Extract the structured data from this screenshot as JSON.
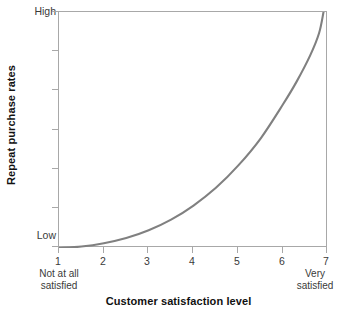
{
  "chart_data": {
    "type": "line",
    "title": "",
    "xlabel": "Customer satisfaction level",
    "ylabel": "Repeat purchase rates",
    "x": [
      1,
      1.5,
      2,
      2.5,
      3,
      3.5,
      4,
      4.5,
      5,
      5.5,
      6,
      6.3,
      6.6,
      6.8,
      6.9
    ],
    "values": [
      0.0,
      0.6,
      2.0,
      4.2,
      7.5,
      12.0,
      18.0,
      25.5,
      35.0,
      46.5,
      61.0,
      70.5,
      81.5,
      91.0,
      100.0
    ],
    "series": [
      {
        "name": "Repeat purchase rate curve",
        "values": [
          0.0,
          0.6,
          2.0,
          4.2,
          7.5,
          12.0,
          18.0,
          25.5,
          35.0,
          46.5,
          61.0,
          70.5,
          81.5,
          91.0,
          100.0
        ]
      }
    ],
    "xlim": [
      1,
      7
    ],
    "ylim": [
      0,
      100
    ],
    "xticks": [
      "1",
      "2",
      "3",
      "4",
      "5",
      "6",
      "7"
    ],
    "yticks": [
      "Low",
      "High"
    ],
    "ytick_count": 7,
    "grid": false,
    "legend": "none",
    "line_color": "#808080",
    "axis_color": "#a8a8a8",
    "annotations": [
      "Not at all satisfied",
      "Very satisfied"
    ]
  },
  "axes": {
    "y": {
      "title": "Repeat purchase rates",
      "top_label": "High",
      "bottom_label": "Low"
    },
    "x": {
      "title": "Customer satisfaction level",
      "ticks": [
        {
          "label": "1"
        },
        {
          "label": "2"
        },
        {
          "label": "3"
        },
        {
          "label": "4"
        },
        {
          "label": "5"
        },
        {
          "label": "6"
        },
        {
          "label": "7"
        }
      ],
      "anchor_low": {
        "line1": "Not at all",
        "line2": "satisfied"
      },
      "anchor_high": {
        "line1": "Very",
        "line2": "satisfied"
      }
    }
  }
}
